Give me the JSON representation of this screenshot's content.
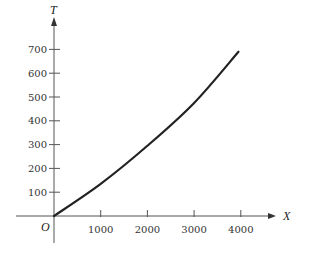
{
  "chart_data": {
    "type": "line",
    "title": "",
    "xlabel": "X",
    "ylabel": "T",
    "origin_label": "O",
    "xlim": [
      0,
      4500
    ],
    "ylim": [
      0,
      750
    ],
    "x_ticks": [
      1000,
      2000,
      3000,
      4000
    ],
    "x_tick_labels": [
      "1000",
      "2000",
      "3000",
      "4000"
    ],
    "y_ticks": [
      100,
      200,
      300,
      400,
      500,
      600,
      700
    ],
    "y_tick_labels": [
      "100",
      "200",
      "300",
      "400",
      "500",
      "600",
      700
    ],
    "grid": false,
    "legend": null,
    "series": [
      {
        "name": "T vs X",
        "x": [
          0,
          1000,
          2000,
          3000,
          3950
        ],
        "y": [
          0,
          135,
          295,
          475,
          690
        ]
      }
    ],
    "colors": {
      "line": "#222222",
      "axis": "#555555"
    }
  }
}
